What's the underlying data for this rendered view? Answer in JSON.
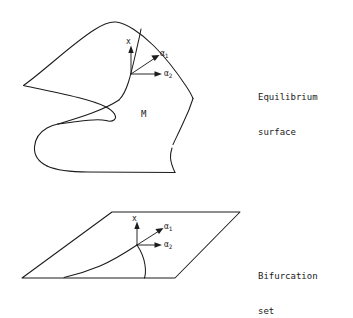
{
  "figure": {
    "title_top": "Equilibrium surface",
    "title_bottom": "Bifurcation set",
    "captions": {
      "top_line1": "Equilibrium",
      "top_line2": "surface",
      "bottom_line1": "Bifurcation",
      "bottom_line2": "set"
    },
    "region_label": "M",
    "axes": {
      "x_label": "x",
      "alpha1_label": "α",
      "alpha1_sub": "1",
      "alpha2_label": "α",
      "alpha2_sub": "2"
    },
    "colors": {
      "background": "#ffffff",
      "stroke": "#1c1c1c",
      "text": "#1a1a1a"
    },
    "panels": [
      {
        "name": "equilibrium-surface",
        "kind": "cusp-catastrophe-manifold",
        "caption": "Equilibrium surface",
        "region_label": "M"
      },
      {
        "name": "bifurcation-set",
        "kind": "control-plane-with-cusp-curve",
        "caption": "Bifurcation set"
      }
    ]
  }
}
